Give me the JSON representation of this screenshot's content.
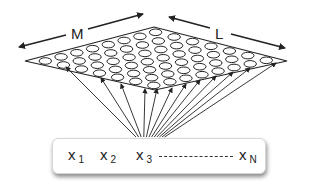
{
  "diagram": {
    "type": "self-organizing-map",
    "grid": {
      "dimension_labels": {
        "width": "M",
        "depth": "L"
      },
      "rows": 7,
      "cols": 8,
      "node_shape": "ellipse",
      "fill_color": "#ffffff",
      "stroke_color": "#222222"
    },
    "input_vector": {
      "items": [
        {
          "base": "x",
          "subscript": "1"
        },
        {
          "base": "x",
          "subscript": "2"
        },
        {
          "base": "x",
          "subscript": "3"
        },
        {
          "base": "x",
          "subscript": "N"
        }
      ],
      "separator": "dashed-ellipsis"
    },
    "connections": {
      "from": "input_vector",
      "to": "grid_nodes",
      "count": 12,
      "style": "arrow"
    }
  }
}
